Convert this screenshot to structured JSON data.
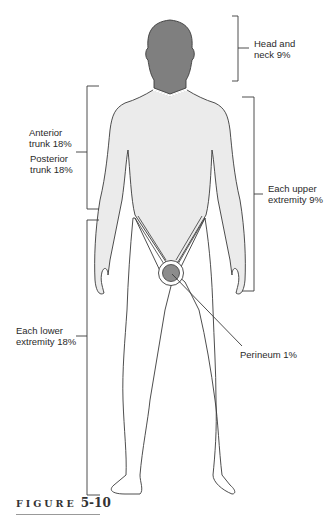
{
  "figure": {
    "caption_word": "FIGURE",
    "caption_number": "5-10",
    "colors": {
      "head_fill": "#7f7f7f",
      "body_fill": "#ebebeb",
      "legs_fill": "#ffffff",
      "perineum_fill": "#8c8c8c",
      "outline": "#3a3a3a"
    }
  },
  "labels": {
    "head_neck": {
      "line1": "Head and",
      "line2": "neck 9%"
    },
    "anterior_trunk": {
      "line1": "Anterior",
      "line2": "trunk 18%"
    },
    "posterior_trunk": {
      "line1": "Posterior",
      "line2": "trunk 18%"
    },
    "upper_extremity": {
      "line1": "Each upper",
      "line2": "extremity 9%"
    },
    "lower_extremity": {
      "line1": "Each lower",
      "line2": "extremity 18%"
    },
    "perineum": {
      "line1": "Perineum 1%"
    }
  },
  "regions": [
    {
      "name": "Head and neck",
      "percent": 9
    },
    {
      "name": "Anterior trunk",
      "percent": 18
    },
    {
      "name": "Posterior trunk",
      "percent": 18
    },
    {
      "name": "Each upper extremity",
      "percent": 9
    },
    {
      "name": "Each lower extremity",
      "percent": 18
    },
    {
      "name": "Perineum",
      "percent": 1
    }
  ]
}
